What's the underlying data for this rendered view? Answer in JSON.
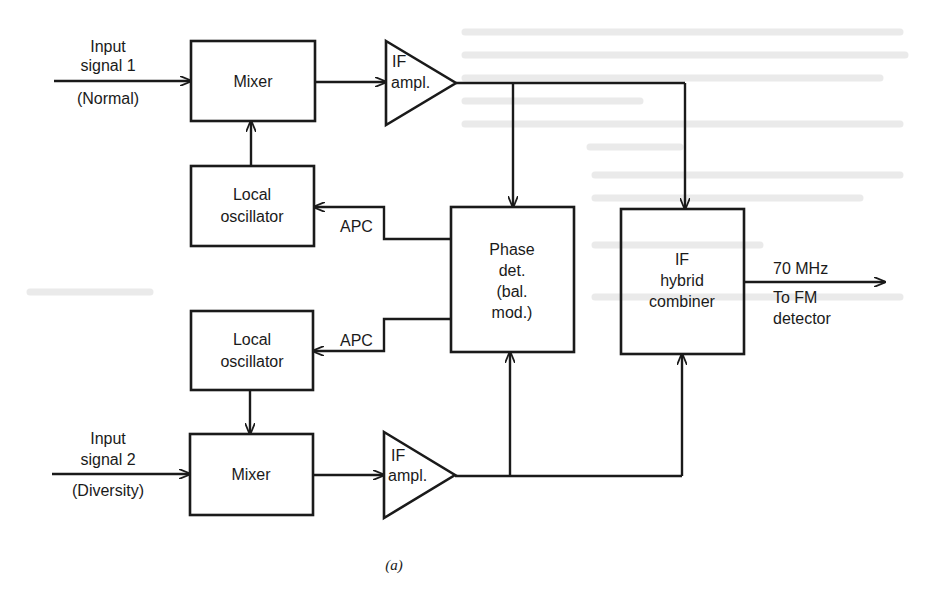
{
  "figure": {
    "caption": "(a)",
    "type": "block-diagram"
  },
  "blocks": {
    "mixer_1": {
      "lines": [
        "Mixer"
      ]
    },
    "mixer_2": {
      "lines": [
        "Mixer"
      ]
    },
    "lo_1": {
      "lines": [
        "Local",
        "oscillator"
      ]
    },
    "lo_2": {
      "lines": [
        "Local",
        "oscillator"
      ]
    },
    "if_amp_1": {
      "lines": [
        "IF",
        "ampl."
      ]
    },
    "if_amp_2": {
      "lines": [
        "IF",
        "ampl."
      ]
    },
    "phase_det": {
      "lines": [
        "Phase",
        "det.",
        "(bal.",
        "mod.)"
      ]
    },
    "combiner": {
      "lines": [
        "IF",
        "hybrid",
        "combiner"
      ]
    }
  },
  "signals": {
    "input_1": {
      "lines": [
        "Input",
        "signal 1"
      ],
      "sub": "(Normal)"
    },
    "input_2": {
      "lines": [
        "Input",
        "signal 2"
      ],
      "sub": "(Diversity)"
    },
    "apc_1": "APC",
    "apc_2": "APC",
    "output": {
      "top": "70 MHz",
      "lines": [
        "To FM",
        "detector"
      ]
    }
  },
  "colors": {
    "ink": "#1a1a1a",
    "paper": "#ffffff"
  }
}
